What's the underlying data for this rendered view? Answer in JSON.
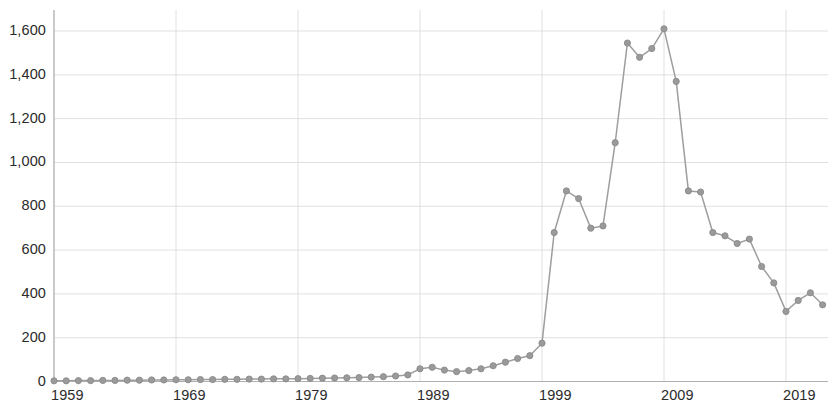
{
  "chart_data": {
    "type": "line",
    "title": "",
    "subtitle": "",
    "xlabel": "",
    "ylabel": "",
    "xlim": [
      1959,
      2022
    ],
    "ylim": [
      0,
      1700
    ],
    "grid": true,
    "legend": null,
    "x_tick_labels": [
      "1959",
      "1969",
      "1979",
      "1989",
      "1999",
      "2009",
      "2019"
    ],
    "x_tick_values": [
      1959,
      1969,
      1979,
      1989,
      1999,
      2009,
      2019
    ],
    "y_tick_labels": [
      "0",
      "200",
      "400",
      "600",
      "800",
      "1,000",
      "1,200",
      "1,400",
      "1,600"
    ],
    "y_tick_values": [
      0,
      200,
      400,
      600,
      800,
      1000,
      1200,
      1400,
      1600
    ],
    "markers": true,
    "line_color": "#9e9e9e",
    "marker_color": "#9a9a9a",
    "grid_color": "#d8d8d8",
    "axis_color": "#b0b0b0",
    "text_color": "#2b2b2b",
    "x": [
      1959,
      1960,
      1961,
      1962,
      1963,
      1964,
      1965,
      1966,
      1967,
      1968,
      1969,
      1970,
      1971,
      1972,
      1973,
      1974,
      1975,
      1976,
      1977,
      1978,
      1979,
      1980,
      1981,
      1982,
      1983,
      1984,
      1985,
      1986,
      1987,
      1988,
      1989,
      1990,
      1991,
      1992,
      1993,
      1994,
      1995,
      1996,
      1997,
      1998,
      1999,
      2000,
      2001,
      2002,
      2003,
      2004,
      2005,
      2006,
      2007,
      2008,
      2009,
      2010,
      2011,
      2012,
      2013,
      2014,
      2015,
      2016,
      2017,
      2018,
      2019,
      2020,
      2021,
      2022
    ],
    "values": [
      3,
      3,
      4,
      4,
      5,
      5,
      6,
      6,
      7,
      7,
      8,
      8,
      9,
      9,
      10,
      10,
      11,
      11,
      12,
      12,
      13,
      14,
      15,
      16,
      17,
      18,
      20,
      22,
      25,
      30,
      58,
      65,
      52,
      45,
      50,
      58,
      72,
      88,
      105,
      118,
      175,
      680,
      870,
      835,
      700,
      710,
      1090,
      1545,
      1480,
      1520,
      1610,
      1370,
      870,
      865,
      680,
      665,
      630,
      650,
      525,
      450,
      320,
      370,
      405,
      350
    ],
    "series": [
      {
        "name": "value",
        "values": [
          3,
          3,
          4,
          4,
          5,
          5,
          6,
          6,
          7,
          7,
          8,
          8,
          9,
          9,
          10,
          10,
          11,
          11,
          12,
          12,
          13,
          14,
          15,
          16,
          17,
          18,
          20,
          22,
          25,
          30,
          58,
          65,
          52,
          45,
          50,
          58,
          72,
          88,
          105,
          118,
          175,
          680,
          870,
          835,
          700,
          710,
          1090,
          1545,
          1480,
          1520,
          1610,
          1370,
          870,
          865,
          680,
          665,
          630,
          650,
          525,
          450,
          320,
          370,
          405,
          350
        ]
      }
    ],
    "annotations": []
  }
}
